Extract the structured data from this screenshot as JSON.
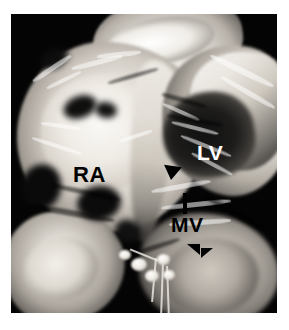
{
  "figure": {
    "kind": "gross-pathology-photograph",
    "modality": "grayscale photograph",
    "background_color": "#ffffff",
    "plate_color": "#000000"
  },
  "annotations": {
    "labels": [
      {
        "id": "ra",
        "text": "RA",
        "meaning": "right atrium",
        "color": "#000000",
        "x": 62,
        "y": 150
      },
      {
        "id": "lv",
        "text": "LV",
        "meaning": "left ventricle",
        "color": "#ffffff",
        "x": 186,
        "y": 128
      },
      {
        "id": "mv",
        "text": "MV",
        "meaning": "mitral valve",
        "color": "#000000",
        "x": 160,
        "y": 200
      }
    ],
    "markers": [
      {
        "id": "pointer-bar",
        "shape": "vertical-bar",
        "color": "#000000",
        "x": 172,
        "y": 179
      },
      {
        "id": "arrowhead-upper",
        "shape": "triangle",
        "color": "#000000",
        "x": 152,
        "y": 152
      },
      {
        "id": "arrowhead-lower",
        "shape": "triangle",
        "color": "#000000",
        "x": 176,
        "y": 230
      },
      {
        "id": "arrowhead-lower2",
        "shape": "triangle",
        "color": "#050505",
        "x": 190,
        "y": 234
      }
    ]
  },
  "plate": {
    "left": 11,
    "top": 14,
    "width": 266,
    "height": 299
  }
}
